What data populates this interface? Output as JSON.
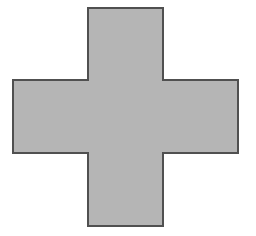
{
  "shape": {
    "type": "cross",
    "fill": "#b5b5b5",
    "stroke": "#505050",
    "stroke_width": 2,
    "points": "88,8 163,8 163,80 238,80 238,153 163,153 163,226 88,226 88,153 13,153 13,80 88,80"
  },
  "background": "#ffffff"
}
